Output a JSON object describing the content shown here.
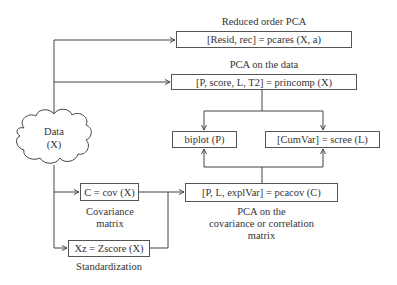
{
  "diagram": {
    "data_node": {
      "line1": "Data",
      "line2": "(X)"
    },
    "reduced_pca": {
      "title": "Reduced order PCA",
      "code": "[Resid, rec] = pcares (X, a)"
    },
    "pca_data": {
      "title": "PCA on the data",
      "code": "[P, score, L, T2] = princomp (X)"
    },
    "biplot": {
      "code": "biplot (P)"
    },
    "scree": {
      "code": "[CumVar] = scree (L)"
    },
    "cov": {
      "code": "C = cov (X)",
      "caption_line1": "Covariance",
      "caption_line2": "matrix"
    },
    "zscore": {
      "code": "Xz = Zscore (X)",
      "caption": "Standardization"
    },
    "pcacov": {
      "code": "[P, L, explVar] = pcacov (C)",
      "caption_line1": "PCA on the",
      "caption_line2": "covariance or correlation",
      "caption_line3": "matrix"
    }
  }
}
